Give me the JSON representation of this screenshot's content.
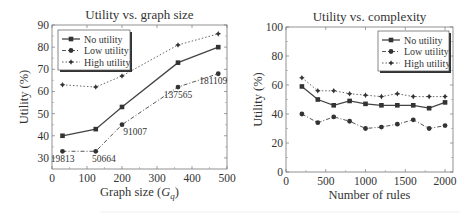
{
  "chart_data": [
    {
      "type": "line",
      "title": "Utility vs. graph size",
      "xlabel": "Graph size (Gq)",
      "ylabel": "Utility (%)",
      "xlim": [
        0,
        500
      ],
      "ylim": [
        25,
        90
      ],
      "xticks": [
        0,
        100,
        200,
        300,
        400,
        500
      ],
      "yticks": [
        30,
        40,
        50,
        60,
        70,
        80,
        90
      ],
      "grid": false,
      "legend_position": "upper left",
      "x": [
        30,
        125,
        200,
        360,
        475
      ],
      "series": [
        {
          "name": "No utility",
          "values": [
            40,
            43,
            53,
            73,
            80
          ],
          "marker": "square",
          "line": "solid"
        },
        {
          "name": "Low utility",
          "values": [
            33,
            33,
            45,
            62,
            68
          ],
          "marker": "circle",
          "line": "dashdot"
        },
        {
          "name": "High utility",
          "values": [
            63,
            62,
            67,
            81,
            86
          ],
          "marker": "diamond",
          "line": "dotted"
        }
      ],
      "annotations": [
        {
          "text": "19813",
          "x": 30,
          "y": 33
        },
        {
          "text": "50664",
          "x": 125,
          "y": 33
        },
        {
          "text": "91007",
          "x": 200,
          "y": 45
        },
        {
          "text": "137565",
          "x": 360,
          "y": 62
        },
        {
          "text": "181109",
          "x": 475,
          "y": 68
        }
      ]
    },
    {
      "type": "line",
      "title": "Utility vs. complexity",
      "xlabel": "Number of rules",
      "ylabel": "Utility (%)",
      "xlim": [
        0,
        2100
      ],
      "ylim": [
        0,
        100
      ],
      "xticks": [
        0,
        500,
        1000,
        1500,
        2000
      ],
      "yticks": [
        0,
        20,
        40,
        60,
        80,
        100
      ],
      "grid": false,
      "legend_position": "upper right",
      "x": [
        200,
        400,
        600,
        800,
        1000,
        1200,
        1400,
        1600,
        1800,
        2000
      ],
      "series": [
        {
          "name": "No utility",
          "values": [
            59,
            50,
            46,
            49,
            47,
            46,
            46,
            46,
            44,
            48
          ],
          "marker": "square",
          "line": "solid"
        },
        {
          "name": "Low utility",
          "values": [
            40,
            34,
            38,
            35,
            30,
            31,
            33,
            36,
            30,
            32
          ],
          "marker": "circle",
          "line": "dashdot"
        },
        {
          "name": "High utility",
          "values": [
            65,
            56,
            56,
            54,
            53,
            52,
            54,
            52,
            52,
            52
          ],
          "marker": "diamond",
          "line": "dotted"
        }
      ]
    }
  ]
}
